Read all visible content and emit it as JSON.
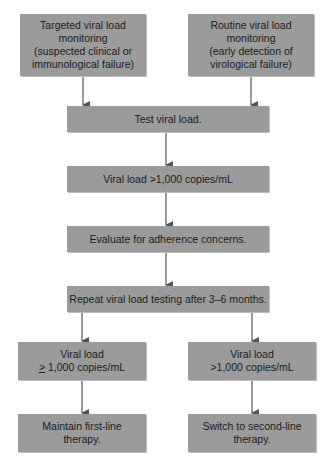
{
  "flowchart": {
    "nodes": {
      "targeted": {
        "lines": [
          "Targeted viral load",
          "monitoring",
          "(suspected clinical or",
          "immunological failure)"
        ]
      },
      "routine": {
        "lines": [
          "Routine viral load",
          "monitoring",
          "(early detection of",
          "virological failure)"
        ]
      },
      "test": {
        "label": "Test viral load."
      },
      "high_vl": {
        "label": "Viral load >1,000 copies/mL"
      },
      "evaluate": {
        "label": "Evaluate for adherence concerns."
      },
      "repeat": {
        "label": "Repeat viral load testing after 3–6 months."
      },
      "left_result": {
        "line1": "Viral load",
        "line2_symbol": ">",
        "line2_rest": " 1,000 copies/mL"
      },
      "right_result": {
        "line1": "Viral load",
        "line2": ">1,000 copies/mL"
      },
      "maintain": {
        "lines": [
          "Maintain first-line",
          "therapy."
        ]
      },
      "switch": {
        "lines": [
          "Switch to second-line",
          "therapy."
        ]
      }
    },
    "edges": [
      {
        "from": "targeted",
        "to": "test"
      },
      {
        "from": "routine",
        "to": "test"
      },
      {
        "from": "test",
        "to": "high_vl"
      },
      {
        "from": "high_vl",
        "to": "evaluate"
      },
      {
        "from": "evaluate",
        "to": "repeat"
      },
      {
        "from": "repeat",
        "to": "left_result"
      },
      {
        "from": "repeat",
        "to": "right_result"
      },
      {
        "from": "left_result",
        "to": "maintain"
      },
      {
        "from": "right_result",
        "to": "switch"
      }
    ],
    "colors": {
      "box_fill": "#9b9b9b",
      "text": "#1c1c1c",
      "arrow": "#555555"
    }
  }
}
